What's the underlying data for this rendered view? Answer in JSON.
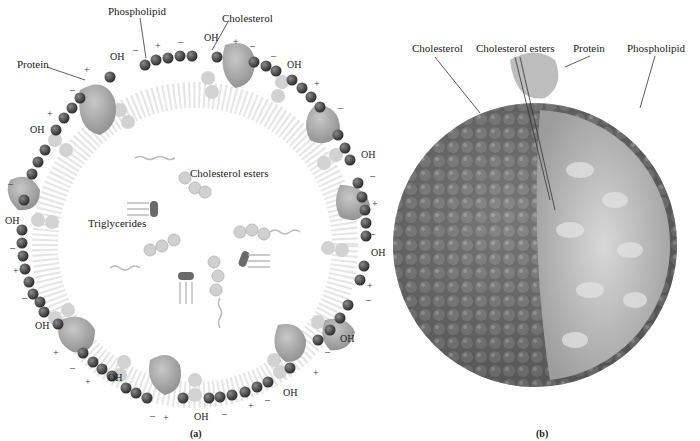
{
  "figure": {
    "panel_a": {
      "caption": "(a)",
      "labels": {
        "phospholipid": "Phospholipid",
        "cholesterol": "Cholesterol",
        "protein": "Protein",
        "cholesterol_esters": "Cholesterol esters",
        "triglycerides": "Triglycerides"
      },
      "hydroxyl_label": "OH",
      "plus": "+",
      "minus": "–"
    },
    "panel_b": {
      "caption": "(b)",
      "labels": {
        "cholesterol": "Cholesterol",
        "cholesterol_esters": "Cholesterol esters",
        "protein": "Protein",
        "phospholipid": "Phospholipid"
      }
    },
    "colors": {
      "phospholipid_head": "#4a4a4a",
      "protein": "#a8a8a8",
      "cholesterol": "#cfcfcf",
      "tails": "#b5b5b5",
      "background": "#ffffff"
    }
  }
}
